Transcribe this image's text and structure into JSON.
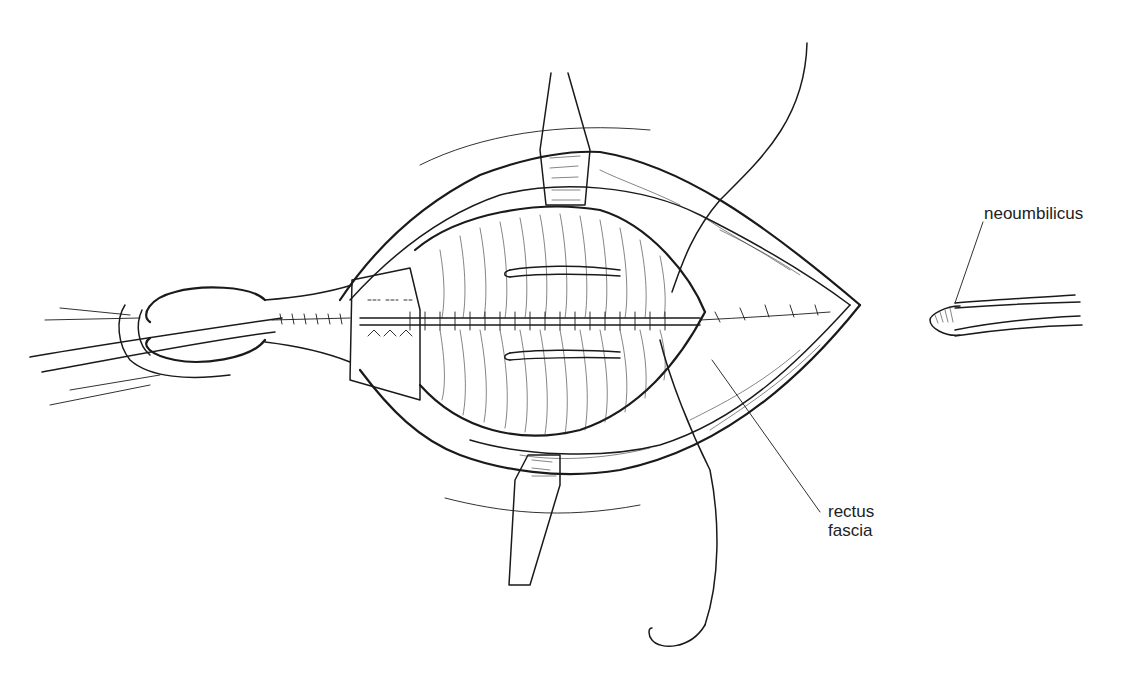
{
  "figure": {
    "type": "surgical line illustration",
    "labels": [
      {
        "id": "neoumbilicus",
        "text": "neoumbilicus"
      },
      {
        "id": "rectus-fascia",
        "text": "rectus\nfascia",
        "lines": [
          "rectus",
          "fascia"
        ]
      }
    ]
  },
  "colors": {
    "ink": "#1a1a1a",
    "background": "#ffffff"
  }
}
